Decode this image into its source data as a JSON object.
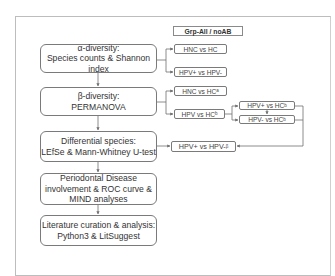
{
  "group_label": "Grp-All / noAB",
  "steps": [
    {
      "id": "alpha",
      "lines": [
        "α-diversity:",
        "Species counts & Shannon",
        "index"
      ]
    },
    {
      "id": "beta",
      "lines": [
        "β-diversity:",
        "PERMANOVA"
      ]
    },
    {
      "id": "differential",
      "lines": [
        "Differential species:",
        "LEfSe & Mann-Whitney U-test"
      ]
    },
    {
      "id": "periodontal",
      "lines": [
        "Periodontal Disease",
        "involvement & ROC curve &",
        "MIND analyses"
      ]
    },
    {
      "id": "literature",
      "lines": [
        "Literature curation & analysis:",
        "Python3 & LitSuggest"
      ]
    }
  ],
  "comparisons": {
    "alpha_1": {
      "text": "HNC  vs HC",
      "sup": ""
    },
    "alpha_2": {
      "text": "HPV+  vs HPV-",
      "sup": ""
    },
    "beta_1": {
      "text": "HNC  vs HC",
      "sup": "a"
    },
    "beta_2": {
      "text": "HPV  vs HC",
      "sup": "b"
    },
    "beta_2a": {
      "text": "HPV+  vs HC",
      "sup": "b"
    },
    "beta_2b": {
      "text": "HPV-  vs HC",
      "sup": "b"
    },
    "diff_1": {
      "text": "HPV+  vs HPV-",
      "sup": "β"
    }
  },
  "colors": {
    "line": "#6e6e6e",
    "border": "#7a7a7a",
    "frame": "#bdbdbd"
  }
}
